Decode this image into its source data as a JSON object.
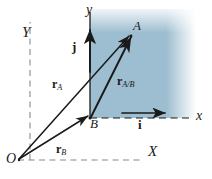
{
  "figure": {
    "colors": {
      "shaded_region": "#9dbdd0",
      "line": "#1a1a1a",
      "dashed_axis": "#8a8a8a",
      "background": "#ffffff"
    }
  },
  "axes": {
    "fixed_frame": {
      "origin_label": "O",
      "x_label": "X",
      "y_label": "Y",
      "style": "dashed"
    },
    "translating_frame": {
      "origin_label": "B",
      "x_label": "x",
      "y_label": "y",
      "style": "solid"
    }
  },
  "points": [
    {
      "name": "point-A",
      "label": "A"
    },
    {
      "name": "point-B",
      "label": "B"
    },
    {
      "name": "origin-O",
      "label": "O"
    }
  ],
  "vectors": [
    {
      "name": "r-A",
      "symbol": "r",
      "subscript": "A",
      "from": "O",
      "to": "A"
    },
    {
      "name": "r-B",
      "symbol": "r",
      "subscript": "B",
      "from": "O",
      "to": "B"
    },
    {
      "name": "r-A-B",
      "symbol": "r",
      "subscript": "A/B",
      "from": "B",
      "to": "A"
    }
  ],
  "unit_vectors": [
    {
      "name": "i",
      "symbol": "i",
      "direction": "x"
    },
    {
      "name": "j",
      "symbol": "j",
      "direction": "y"
    }
  ]
}
